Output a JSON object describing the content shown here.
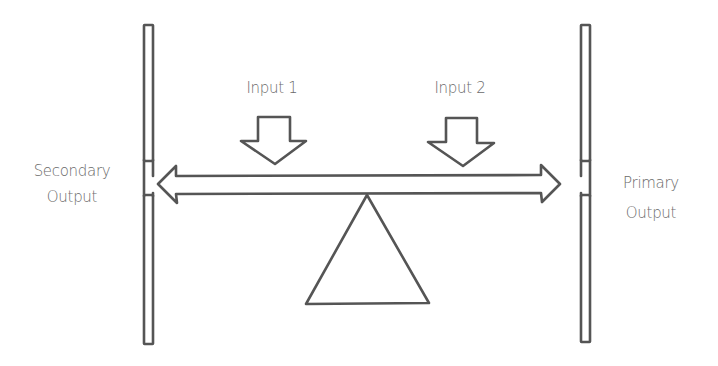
{
  "diagram": {
    "type": "balance-seesaw",
    "stroke_color": "#555555",
    "text_color": "#6a6a6a",
    "background": "#ffffff",
    "inputs": [
      {
        "label": "Input 1"
      },
      {
        "label": "Input 2"
      }
    ],
    "outputs": {
      "left": {
        "line1": "Secondary",
        "line2": "Output"
      },
      "right": {
        "line1": "Primary",
        "line2": "Output"
      }
    }
  }
}
